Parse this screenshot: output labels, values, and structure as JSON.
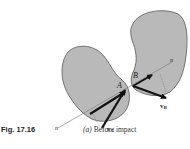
{
  "figure": {
    "number_label": "Fig. 17.16",
    "caption_part": "(a)",
    "caption_text": "Before impact"
  },
  "bodies": [
    {
      "name": "body-A",
      "contact_label": "A",
      "velocity_label": "v",
      "velocity_subscript": "A"
    },
    {
      "name": "body-B",
      "contact_label": "B",
      "velocity_label": "v",
      "velocity_subscript": "B"
    }
  ],
  "line_of_impact": {
    "label_lower": "n",
    "label_upper": "n"
  },
  "colors": {
    "body_fill": "#b9b9b9",
    "outline": "#555555",
    "vector": "#111111",
    "line": "#777777"
  }
}
